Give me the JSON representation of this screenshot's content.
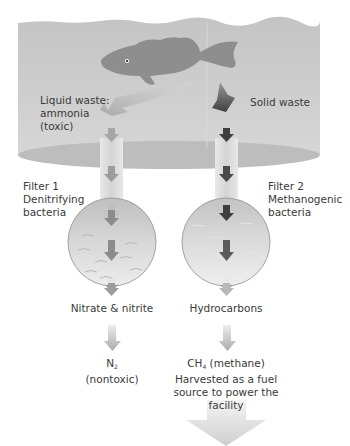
{
  "diagram": {
    "title": "",
    "colors": {
      "water": "#c9c9c9",
      "water_bottom": "#bdbdbd",
      "fish": "#8e8e8e",
      "liquid_arrow": "#b0b0b0",
      "solid_arrow": "#4a4a4a",
      "pipe": "#dedede",
      "filter_circle": "#d0d0d0",
      "text": "#3a3a3a"
    },
    "tank": {
      "liquid_waste_label": [
        "Liquid waste:",
        "ammonia",
        "(toxic)"
      ],
      "solid_waste_label": "Solid waste",
      "fish_icon": "fish-icon"
    },
    "filters": [
      {
        "name": "Filter 1",
        "description": "Denitrifying",
        "description2": "bacteria",
        "output": "Nitrate & nitrite",
        "final_output_formula": "N",
        "final_output_subscript": "2",
        "final_output_note": "(nontoxic)"
      },
      {
        "name": "Filter 2",
        "description": "Methanogenic",
        "description2": "bacteria",
        "output": "Hydrocarbons",
        "final_output_formula": "CH",
        "final_output_subscript": "4",
        "final_output_suffix": " (methane)",
        "final_output_note_lines": [
          "Harvested as a fuel",
          "source to power the",
          "facility"
        ]
      }
    ]
  }
}
